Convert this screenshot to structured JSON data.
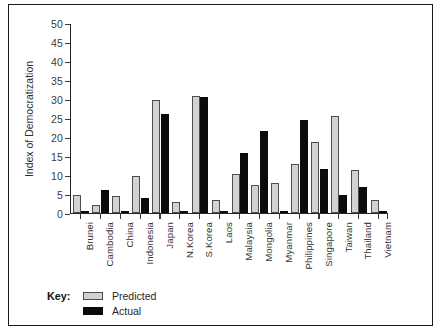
{
  "chart_data": {
    "type": "bar",
    "title": "",
    "xlabel": "",
    "ylabel": "Index of Democratization",
    "ylim": [
      0,
      50
    ],
    "yticks": [
      0,
      5,
      10,
      15,
      20,
      25,
      30,
      35,
      40,
      45,
      50
    ],
    "grid": false,
    "legend_position": "bottom-left",
    "legend_title": "Key:",
    "categories": [
      "Brunei",
      "Cambodia",
      "China",
      "Indonesia",
      "Japan",
      "N.Korea",
      "S.Korea",
      "Laos",
      "Malaysia",
      "Mongolia",
      "Myanmar",
      "Philippines",
      "Singapore",
      "Taiwan",
      "Thailand",
      "Vietnam"
    ],
    "series": [
      {
        "name": "Predicted",
        "color": "#d2d2d2",
        "values": [
          4.7,
          2.0,
          4.5,
          9.8,
          29.8,
          2.8,
          30.8,
          3.3,
          10.2,
          7.5,
          7.8,
          13.0,
          18.6,
          25.5,
          11.3,
          3.5
        ]
      },
      {
        "name": "Actual",
        "color": "#0b0b0b",
        "values": [
          0.3,
          6.0,
          0.3,
          4.0,
          26.0,
          0.2,
          30.6,
          0.2,
          15.8,
          21.5,
          0.3,
          24.5,
          11.6,
          4.7,
          6.8,
          0.2
        ]
      }
    ]
  }
}
